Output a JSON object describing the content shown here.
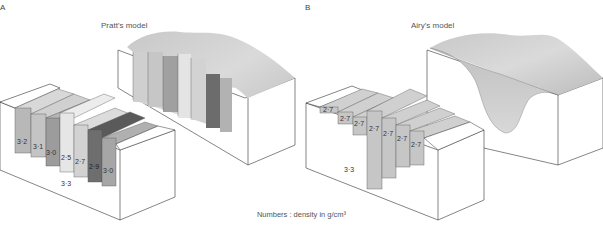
{
  "panels": [
    {
      "letter": "A",
      "title": "Pratt's model",
      "columns": [
        {
          "density": "3·2",
          "color": "#b8b8b8"
        },
        {
          "density": "3·1",
          "color": "#c4c4c4"
        },
        {
          "density": "3·0",
          "color": "#9c9c9c"
        },
        {
          "density": "2·5",
          "color": "#e6e6e6"
        },
        {
          "density": "2·7",
          "color": "#d2d2d2"
        },
        {
          "density": "2·9",
          "color": "#6e6e6e"
        },
        {
          "density": "3·0",
          "color": "#a6a6a6"
        }
      ],
      "mantle_density": "3·3"
    },
    {
      "letter": "B",
      "title": "Airy's model",
      "columns": [
        {
          "density": "2·7"
        },
        {
          "density": "2·7"
        },
        {
          "density": "2·7"
        },
        {
          "density": "2·7"
        },
        {
          "density": "2·7"
        },
        {
          "density": "2·7"
        },
        {
          "density": "2·7"
        }
      ],
      "mantle_density": "3·3"
    }
  ],
  "caption": "Numbers : density in g/cm³"
}
